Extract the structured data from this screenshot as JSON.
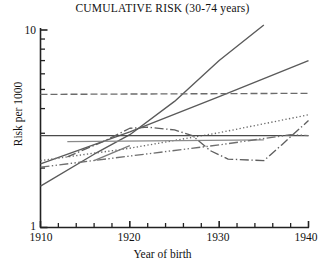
{
  "chart_data": {
    "type": "line",
    "title": "CUMULATIVE RISK (30-74 years)",
    "xlabel": "Year of birth",
    "ylabel": "Risk per 1000",
    "xlim": [
      1910,
      1940
    ],
    "ylim": [
      1,
      10
    ],
    "yscale": "log",
    "grid": false,
    "legend": "none",
    "xticks": [
      1910,
      1920,
      1930,
      1940
    ],
    "xtick_labels": [
      "1910",
      "1920",
      "1930",
      "1940"
    ],
    "xminor_tick_interval": 2,
    "yticks": [
      1,
      10
    ],
    "ytick_labels": [
      "1",
      "10"
    ],
    "yminor_ticks": [
      2,
      3,
      4,
      5,
      6,
      7,
      8,
      9
    ],
    "series": [
      {
        "name": "series-1-steep-rising",
        "style": "solid",
        "color": "#5a5a5a",
        "x": [
          1910,
          1916,
          1920,
          1925,
          1930,
          1935
        ],
        "y": [
          1.62,
          2.35,
          2.95,
          4.35,
          7.0,
          10.6
        ]
      },
      {
        "name": "series-2-rising",
        "style": "solid",
        "color": "#5a5a5a",
        "x": [
          1910,
          1920,
          1930,
          1940
        ],
        "y": [
          2.1,
          3.05,
          4.6,
          7.0
        ]
      },
      {
        "name": "series-3-flat-high-dashed",
        "style": "dashed",
        "color": "#6b6b6b",
        "x": [
          1910,
          1940
        ],
        "y": [
          4.72,
          4.78
        ]
      },
      {
        "name": "series-4-dotted-rising",
        "style": "dotted",
        "color": "#6b6b6b",
        "x": [
          1910,
          1920,
          1930,
          1940
        ],
        "y": [
          2.18,
          2.52,
          3.02,
          3.72
        ]
      },
      {
        "name": "series-5-flat-mid-solid",
        "style": "solid",
        "color": "#4a4a4a",
        "x": [
          1910,
          1940
        ],
        "y": [
          2.92,
          2.92
        ]
      },
      {
        "name": "series-6-flat-mid-grey",
        "style": "solid",
        "color": "#8a8a8a",
        "x": [
          1913,
          1935
        ],
        "y": [
          2.72,
          2.78
        ]
      },
      {
        "name": "series-7-dashdot-peak-dip",
        "style": "dashdot",
        "color": "#5f5f5f",
        "x": [
          1913,
          1917,
          1920,
          1922,
          1925,
          1927,
          1929,
          1931,
          1935,
          1937,
          1940
        ],
        "y": [
          2.28,
          2.72,
          3.18,
          3.22,
          3.12,
          2.92,
          2.45,
          2.22,
          2.18,
          2.62,
          3.48
        ]
      },
      {
        "name": "series-8-dashdotdot-rising",
        "style": "dashdotdot",
        "color": "#6f6f6f",
        "x": [
          1910,
          1920,
          1930,
          1938,
          1940
        ],
        "y": [
          2.02,
          2.3,
          2.62,
          2.95,
          2.92
        ]
      },
      {
        "name": "series-9-short-rising-left",
        "style": "solid",
        "color": "#7a7a7a",
        "x": [
          1916,
          1920
        ],
        "y": [
          2.18,
          2.6
        ]
      }
    ]
  },
  "axes": {
    "title": "CUMULATIVE RISK (30-74 years)",
    "x_axis_label": "Year of birth",
    "y_axis_label": "Risk per 1000",
    "y_top_label": "10",
    "y_bottom_label": "1",
    "x_labels": [
      "1910",
      "1920",
      "1930",
      "1940"
    ]
  }
}
